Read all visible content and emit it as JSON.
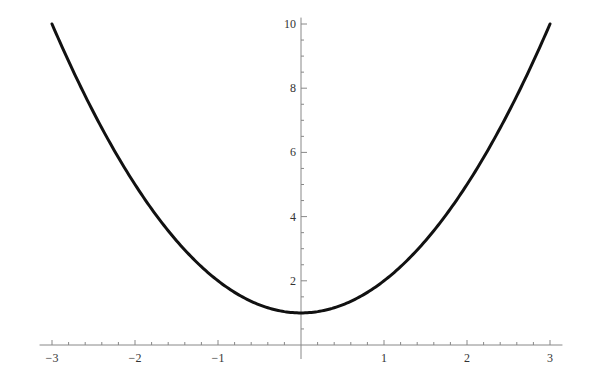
{
  "chart_data": {
    "type": "line",
    "title": "",
    "xlabel": "",
    "ylabel": "",
    "function": "y = x^2 + 1",
    "xlim": [
      -3,
      3
    ],
    "ylim": [
      0,
      10
    ],
    "grid": false,
    "legend": null,
    "x_ticks": [
      -3,
      -2,
      -1,
      1,
      2,
      3
    ],
    "x_tick_labels": [
      "−3",
      "−2",
      "−1",
      "1",
      "2",
      "3"
    ],
    "y_ticks": [
      2,
      4,
      6,
      8,
      10
    ],
    "y_tick_labels": [
      "2",
      "4",
      "6",
      "8",
      "10"
    ],
    "series": [
      {
        "name": "x^2+1",
        "x": [
          -3,
          -2.5,
          -2,
          -1.5,
          -1,
          -0.5,
          0,
          0.5,
          1,
          1.5,
          2,
          2.5,
          3
        ],
        "y": [
          10,
          7.25,
          5,
          3.25,
          2,
          1.25,
          1,
          1.25,
          2,
          3.25,
          5,
          7.25,
          10
        ],
        "color": "#111111"
      }
    ]
  },
  "colors": {
    "axis": "#888888",
    "curve": "#111111",
    "background": "#ffffff"
  }
}
